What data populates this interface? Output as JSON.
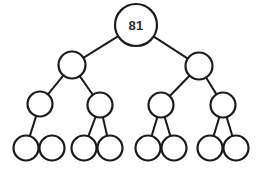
{
  "diagram": {
    "type": "binary-tree",
    "background_color": "#ffffff",
    "stroke_color": "#1a1a1a",
    "node_fill_color": "#ffffff",
    "label_color": "#2b2b2b",
    "canvas": {
      "width": 269,
      "height": 172
    },
    "levels": 4,
    "node_count": 15,
    "edge_count": 13,
    "labeled_node_count": 1
  },
  "nodes": [
    {
      "id": "n0",
      "label": "81",
      "level": 0,
      "cx": 136,
      "cy": 25,
      "r": 21
    },
    {
      "id": "n1",
      "label": "",
      "level": 1,
      "cx": 72,
      "cy": 65,
      "r": 13.5
    },
    {
      "id": "n2",
      "label": "",
      "level": 1,
      "cx": 199,
      "cy": 66,
      "r": 13.5
    },
    {
      "id": "n3",
      "label": "",
      "level": 2,
      "cx": 40,
      "cy": 104,
      "r": 12.5
    },
    {
      "id": "n4",
      "label": "",
      "level": 2,
      "cx": 100,
      "cy": 105,
      "r": 12.5
    },
    {
      "id": "n5",
      "label": "",
      "level": 2,
      "cx": 161,
      "cy": 105,
      "r": 12.5
    },
    {
      "id": "n6",
      "label": "",
      "level": 2,
      "cx": 223,
      "cy": 105,
      "r": 12.5
    },
    {
      "id": "n7",
      "label": "",
      "level": 3,
      "cx": 26,
      "cy": 148,
      "r": 12.5
    },
    {
      "id": "n8",
      "label": "",
      "level": 3,
      "cx": 52,
      "cy": 148,
      "r": 12.5
    },
    {
      "id": "n9",
      "label": "",
      "level": 3,
      "cx": 84,
      "cy": 148,
      "r": 12.5
    },
    {
      "id": "n10",
      "label": "",
      "level": 3,
      "cx": 110,
      "cy": 148,
      "r": 12.5
    },
    {
      "id": "n11",
      "label": "",
      "level": 3,
      "cx": 148,
      "cy": 148,
      "r": 12.5
    },
    {
      "id": "n12",
      "label": "",
      "level": 3,
      "cx": 174,
      "cy": 148,
      "r": 12.5
    },
    {
      "id": "n13",
      "label": "",
      "level": 3,
      "cx": 210,
      "cy": 148,
      "r": 12.5
    },
    {
      "id": "n14",
      "label": "",
      "level": 3,
      "cx": 236,
      "cy": 148,
      "r": 12.5
    }
  ],
  "edges": [
    {
      "from": "n0",
      "to": "n1"
    },
    {
      "from": "n0",
      "to": "n2"
    },
    {
      "from": "n1",
      "to": "n3"
    },
    {
      "from": "n1",
      "to": "n4"
    },
    {
      "from": "n2",
      "to": "n5"
    },
    {
      "from": "n2",
      "to": "n6"
    },
    {
      "from": "n3",
      "to": "n7"
    },
    {
      "from": "n4",
      "to": "n9"
    },
    {
      "from": "n4",
      "to": "n10"
    },
    {
      "from": "n5",
      "to": "n11"
    },
    {
      "from": "n5",
      "to": "n12"
    },
    {
      "from": "n6",
      "to": "n13"
    },
    {
      "from": "n6",
      "to": "n14"
    }
  ]
}
